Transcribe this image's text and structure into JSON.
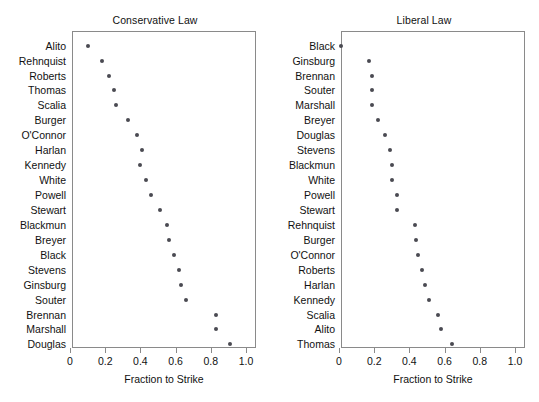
{
  "figure": {
    "width": 539,
    "height": 402,
    "background": "#ffffff",
    "point_color": "#4a4a52",
    "frame_color": "#8a8a8a",
    "text_color": "#111111"
  },
  "chart_data": [
    {
      "type": "scatter",
      "title": "Conservative Law",
      "xlabel": "Fraction to Strike",
      "ylabel": "",
      "xlim": [
        0,
        1.05
      ],
      "xticks": [
        0,
        0.2,
        0.4,
        0.6,
        0.8,
        1.0
      ],
      "xticklabels": [
        "0",
        "0.2",
        "0.4",
        "0.6",
        "0.8",
        "1.0"
      ],
      "grid": false,
      "legend": null,
      "orientation": "dotplot-horizontal",
      "categories": [
        "Alito",
        "Rehnquist",
        "Roberts",
        "Thomas",
        "Scalia",
        "Burger",
        "O'Connor",
        "Harlan",
        "Kennedy",
        "White",
        "Powell",
        "Stewart",
        "Blackmun",
        "Breyer",
        "Black",
        "Stevens",
        "Ginsburg",
        "Souter",
        "Brennan",
        "Marshall",
        "Douglas"
      ],
      "values": [
        0.1,
        0.18,
        0.22,
        0.25,
        0.26,
        0.33,
        0.38,
        0.41,
        0.4,
        0.43,
        0.46,
        0.51,
        0.55,
        0.56,
        0.59,
        0.62,
        0.63,
        0.66,
        0.83,
        0.83,
        0.91
      ]
    },
    {
      "type": "scatter",
      "title": "Liberal Law",
      "xlabel": "Fraction to Strike",
      "ylabel": "",
      "xlim": [
        0,
        1.05
      ],
      "xticks": [
        0,
        0.2,
        0.4,
        0.6,
        0.8,
        1.0
      ],
      "xticklabels": [
        "0",
        "0.2",
        "0.4",
        "0.6",
        "0.8",
        "1.0"
      ],
      "grid": false,
      "legend": null,
      "orientation": "dotplot-horizontal",
      "categories": [
        "Black",
        "Ginsburg",
        "Brennan",
        "Souter",
        "Marshall",
        "Breyer",
        "Douglas",
        "Stevens",
        "Blackmun",
        "White",
        "Powell",
        "Stewart",
        "Rehnquist",
        "Burger",
        "O'Connor",
        "Roberts",
        "Harlan",
        "Kennedy",
        "Scalia",
        "Alito",
        "Thomas"
      ],
      "values": [
        0.01,
        0.17,
        0.19,
        0.19,
        0.19,
        0.22,
        0.26,
        0.29,
        0.3,
        0.3,
        0.33,
        0.33,
        0.43,
        0.44,
        0.45,
        0.47,
        0.49,
        0.51,
        0.56,
        0.58,
        0.64
      ]
    }
  ]
}
